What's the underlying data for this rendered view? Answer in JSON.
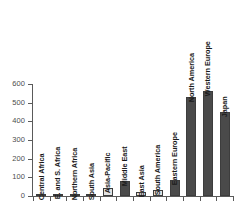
{
  "chart_data": {
    "type": "bar",
    "title": "",
    "xlabel": "",
    "ylabel": "",
    "ylim": [
      0,
      600
    ],
    "yticks": [
      0,
      100,
      200,
      300,
      400,
      500,
      600
    ],
    "ytick_labels": [
      "0",
      "100",
      "200",
      "300",
      "400",
      "500",
      "600"
    ],
    "grid": false,
    "legend": null,
    "orientation": "vertical",
    "label_placement": "rotated-inside-bar",
    "categories": [
      "Central Africa",
      "E. and S. Africa",
      "Northern Africa",
      "South Asia",
      "Asia-Pacific",
      "Middle East",
      "East Asia",
      "South America",
      "Eastern Europe",
      "North America",
      "Western Europe",
      "Japan"
    ],
    "values": [
      4,
      12,
      7,
      6,
      45,
      78,
      20,
      33,
      88,
      530,
      565,
      450
    ],
    "bar_shades": [
      "light",
      "dark",
      "light",
      "light",
      "light",
      "dark",
      "light",
      "light",
      "dark",
      "dark",
      "dark",
      "dark"
    ],
    "colors": {
      "light_bar": "#e2e2e2",
      "dark_bar": "#4a4a4a",
      "bar_outline": "#3d3d3d",
      "axis": "#5a5a5a",
      "tick_text": "#4d4d4d",
      "label_text": "#1a1a1a",
      "background": "#ffffff"
    }
  }
}
